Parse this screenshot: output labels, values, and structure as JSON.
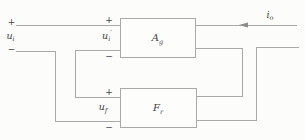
{
  "figure": {
    "colors": {
      "background": "#fcfcfa",
      "line": "#a9a9a9",
      "block_fill": "#fdfdfc",
      "text": "#424242",
      "arrow": "#8b8b8b"
    },
    "blocks": [
      {
        "name": "amplifier-block",
        "x": 120,
        "y": 18,
        "w": 75,
        "h": 39,
        "label": {
          "main": "A",
          "sub": "g"
        }
      },
      {
        "name": "feedback-network-block",
        "x": 120,
        "y": 88,
        "w": 76,
        "h": 39,
        "label": {
          "main": "F",
          "sub": "r"
        }
      }
    ],
    "wires": [
      {
        "name": "input-plus-wire",
        "points": [
          [
            16,
            25
          ],
          [
            120,
            25
          ]
        ]
      },
      {
        "name": "output-top-wire",
        "points": [
          [
            195,
            25
          ],
          [
            297,
            25
          ]
        ]
      },
      {
        "name": "source-minus-to-feedback-wire",
        "points": [
          [
            16,
            51
          ],
          [
            55.5,
            51
          ],
          [
            55.5,
            121
          ],
          [
            120,
            121
          ]
        ]
      },
      {
        "name": "amp-minus-to-feedback-wire",
        "points": [
          [
            120,
            50
          ],
          [
            75,
            50
          ],
          [
            75,
            97
          ],
          [
            120,
            97
          ]
        ]
      },
      {
        "name": "amp-output-return-wire",
        "points": [
          [
            195,
            48
          ],
          [
            242.5,
            48
          ],
          [
            242.5,
            96.5
          ],
          [
            196,
            96.5
          ]
        ]
      },
      {
        "name": "feedback-output-wire",
        "points": [
          [
            196,
            120
          ],
          [
            256.5,
            120
          ],
          [
            256.5,
            47
          ],
          [
            299,
            47
          ]
        ]
      }
    ],
    "arrow": {
      "name": "output-current-arrow",
      "tip": [
        239,
        25
      ],
      "length": 9,
      "half_width": 2.6
    },
    "labels": [
      {
        "name": "source-plus-sign",
        "x": 11.5,
        "y": 24.5,
        "text": "+",
        "sign": true
      },
      {
        "name": "source-voltage-label",
        "x": 10.5,
        "y": 38.5,
        "main": "u",
        "sub": "i"
      },
      {
        "name": "source-minus-sign",
        "x": 11.5,
        "y": 52,
        "text": "−",
        "sign": true
      },
      {
        "name": "amp-input-plus-sign",
        "x": 109,
        "y": 22.5,
        "text": "+",
        "sign": true
      },
      {
        "name": "amp-input-voltage-label",
        "x": 107,
        "y": 38.5,
        "main": "u",
        "sub": "i",
        "prime": true
      },
      {
        "name": "amp-input-minus-sign",
        "x": 109,
        "y": 58.5,
        "text": "−",
        "sign": true
      },
      {
        "name": "feedback-plus-sign",
        "x": 109,
        "y": 94.5,
        "text": "+",
        "sign": true
      },
      {
        "name": "feedback-voltage-label",
        "x": 103,
        "y": 110,
        "main": "u",
        "sub": "f"
      },
      {
        "name": "feedback-minus-sign",
        "x": 109,
        "y": 130,
        "text": "−",
        "sign": true
      },
      {
        "name": "output-current-label",
        "x": 270,
        "y": 17.5,
        "main": "i",
        "sub": "o"
      }
    ]
  }
}
